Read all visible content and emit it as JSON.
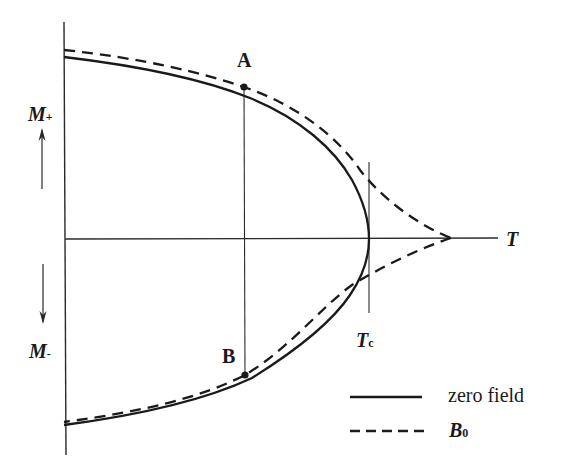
{
  "figure": {
    "type": "phase-diagram",
    "axes": {
      "x_label": "T",
      "y_label_positive": "M",
      "y_label_positive_sub": "+",
      "y_label_negative": "M",
      "y_label_negative_sub": "-"
    },
    "critical_temperature": {
      "label": "T",
      "label_sub": "c"
    },
    "points": [
      {
        "id": "A",
        "label": "A",
        "branch": "upper"
      },
      {
        "id": "B",
        "label": "B",
        "branch": "lower"
      }
    ],
    "legend": [
      {
        "style": "solid",
        "label": "zero field"
      },
      {
        "style": "dashed",
        "label": "B",
        "label_sub": "0"
      }
    ],
    "colors": {
      "ink": "#1a1a1a",
      "background": "#ffffff"
    }
  }
}
